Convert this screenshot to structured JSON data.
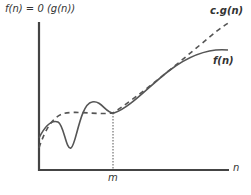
{
  "title": "f(n) = 0 (g(n))",
  "labels": {
    "cg": "c.g(n)",
    "f": "f(n)",
    "m": "m",
    "n": "n"
  },
  "colors": {
    "axis": "#444444",
    "curve": "#555555",
    "text": "#333333"
  },
  "curves": [
    {
      "name": "f(n)",
      "style": "solid"
    },
    {
      "name": "c.g(n)",
      "style": "dashed"
    }
  ]
}
